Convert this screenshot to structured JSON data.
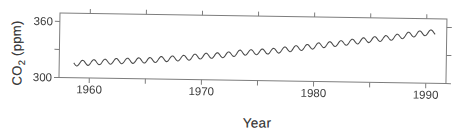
{
  "figure": {
    "background": "#ffffff",
    "ink_color": "#4a4a4a",
    "frame_color": "#7d7d7d",
    "text_color": "#3b3b3b"
  },
  "chart_data": {
    "type": "line",
    "title": "",
    "xlabel": "Year",
    "ylabel": "CO2 (ppm)",
    "ylabel_parts": {
      "prefix": "CO",
      "sub": "2",
      "suffix": " (ppm)"
    },
    "x_range": [
      1957.3,
      1991.8
    ],
    "y_range": [
      300,
      369
    ],
    "x_ticks_major": [
      1960,
      1970,
      1980,
      1990
    ],
    "x_ticks_minor": [
      1965,
      1975,
      1985
    ],
    "y_ticks_labeled": [
      300,
      360
    ],
    "y_ticks_unlabeled": [
      330
    ],
    "grid": false,
    "legend": false,
    "series": [
      {
        "name": "Atmospheric CO2 monthly mean (Keeling curve, Mauna Loa)",
        "start_year": 1958,
        "end_year": 1991,
        "annual_means": [
          315.3,
          316.0,
          316.9,
          317.6,
          318.5,
          319.0,
          319.6,
          320.0,
          321.4,
          322.2,
          323.0,
          324.6,
          325.7,
          326.3,
          327.5,
          329.7,
          330.2,
          331.1,
          332.0,
          333.8,
          335.4,
          336.8,
          338.8,
          340.1,
          341.5,
          343.2,
          344.9,
          346.3,
          347.6,
          349.3,
          351.7,
          353.2,
          354.4,
          355.6
        ],
        "seasonal_amplitude_ppm": 2.9,
        "seasonal_peak_fraction": 0.38,
        "data_start": 1958.6,
        "data_end": 1990.8
      }
    ]
  }
}
